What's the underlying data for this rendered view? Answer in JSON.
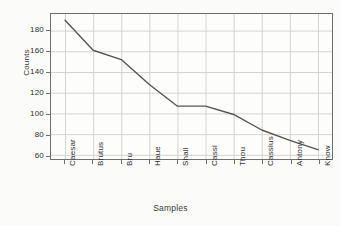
{
  "chart_data": {
    "type": "line",
    "title": "",
    "xlabel": "Samples",
    "ylabel": "Counts",
    "categories": [
      "Caesar",
      "Brutus",
      "Bru",
      "Haue",
      "Shall",
      "Cassi",
      "Thou",
      "Cassius",
      "Antony",
      "Know"
    ],
    "values": [
      190,
      161,
      152,
      128,
      107,
      107,
      99,
      84,
      74,
      65
    ],
    "series": [
      {
        "name": "Counts",
        "values": [
          190,
          161,
          152,
          128,
          107,
          107,
          99,
          84,
          74,
          65
        ]
      }
    ],
    "ytick_labels": [
      "180",
      "160",
      "140",
      "120",
      "100",
      "80",
      "60"
    ],
    "ytick_values": [
      180,
      160,
      140,
      120,
      100,
      80,
      60
    ],
    "ylim": [
      56,
      196
    ],
    "grid": true,
    "legend": "none",
    "line_color": "#555555",
    "grid_color": "#d2d2d2",
    "axis_color": "#6f6f6f",
    "background_color": "#fbfbfa"
  }
}
